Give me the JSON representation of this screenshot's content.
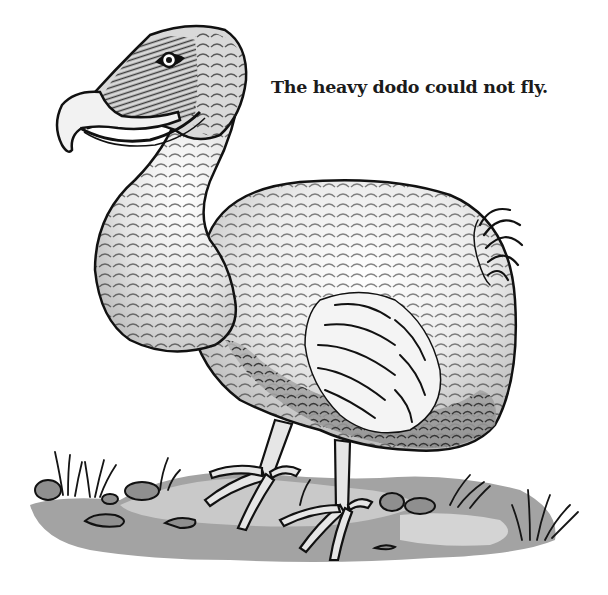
{
  "page": {
    "top_fragment_text": "",
    "caption": "The heavy dodo could not fly."
  },
  "illustration": {
    "subject": "dodo bird",
    "style": "black-and-white ink drawing with gray wash",
    "elements": [
      "head",
      "hooked-beak",
      "eye",
      "neck",
      "body",
      "wing",
      "tail-feathers",
      "legs",
      "feet",
      "ground",
      "grass",
      "rocks"
    ],
    "colors": {
      "ink": "#111111",
      "paper": "#ffffff",
      "light_wash": "#dcdcdc",
      "mid_wash": "#a9a9a9",
      "dark_wash": "#8a8a8a",
      "beak": "#f2f2f2"
    }
  }
}
